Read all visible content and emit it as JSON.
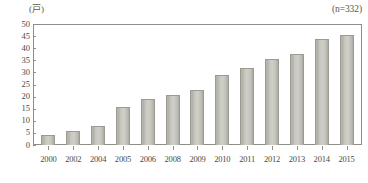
{
  "chart_data": {
    "type": "bar",
    "title": "",
    "subtitle": "",
    "xlabel": "",
    "ylabel": "(戸)",
    "unit_label": "(戸)",
    "sample_size_label": "(n=332)",
    "categories": [
      "2000",
      "2002",
      "2004",
      "2005",
      "2006",
      "2008",
      "2009",
      "2010",
      "2011",
      "2012",
      "2013",
      "2014",
      "2015"
    ],
    "values": [
      4,
      6,
      8,
      16,
      19,
      21,
      23,
      29,
      32,
      36,
      38,
      44,
      46
    ],
    "series": [
      {
        "name": "戸数",
        "values": [
          4,
          6,
          8,
          16,
          19,
          21,
          23,
          29,
          32,
          36,
          38,
          44,
          46
        ]
      }
    ],
    "ylim": [
      0,
      50
    ],
    "ytick_values": [
      50,
      45,
      40,
      35,
      30,
      25,
      20,
      15,
      10,
      5,
      0
    ],
    "ytick_labels": [
      "50",
      "45",
      "40",
      "35",
      "30",
      "25",
      "20",
      "15",
      "10",
      "5",
      "0"
    ],
    "ytick_step": 5,
    "xtick_labels": [
      "2000",
      "2002",
      "2004",
      "2005",
      "2006",
      "2008",
      "2009",
      "2010",
      "2011",
      "2012",
      "2013",
      "2014",
      "2015"
    ],
    "grid": false,
    "legend": false,
    "legend_position": "none",
    "annotations": [
      {
        "text": "(戸)",
        "position": "top-left"
      },
      {
        "text": "(n=332)",
        "position": "top-right"
      }
    ],
    "colors": {
      "bar_fill": "#c8c8c0",
      "bar_edge": "#9b9b92",
      "axis": "#8e8e86",
      "text": "#4a4a44",
      "background": "#ffffff"
    }
  }
}
